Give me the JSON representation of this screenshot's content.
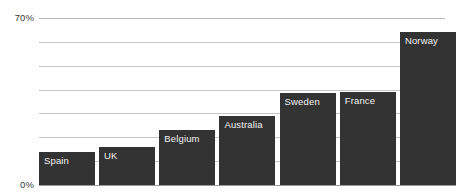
{
  "chart_data": {
    "type": "bar",
    "title": "",
    "subtitle": "",
    "xlabel": "",
    "ylabel": "",
    "categories": [
      "Spain",
      "UK",
      "Belgium",
      "Australia",
      "Sweden",
      "France",
      "Norway"
    ],
    "values": [
      14,
      16,
      23,
      29,
      38.5,
      39,
      64
    ],
    "value_suffix": "%",
    "ylim": [
      0,
      70
    ],
    "y_tick_labels": [
      "0%",
      "70%"
    ],
    "y_ticks_visible": [
      0,
      70
    ],
    "gridlines": [
      70,
      60,
      50,
      40,
      30,
      20,
      10
    ],
    "grid": true,
    "legend": "none",
    "bar_color": "#333333",
    "bar_label_color": "#f2f2f2",
    "gridline_color": "#b9b9b9",
    "axis_text_color": "#3c3c3c",
    "background_color": "#ffffff"
  },
  "axis": {
    "top_label": "70%",
    "bottom_label": "0%"
  },
  "bars": [
    {
      "label": "Spain",
      "value": 14
    },
    {
      "label": "UK",
      "value": 16
    },
    {
      "label": "Belgium",
      "value": 23
    },
    {
      "label": "Australia",
      "value": 29
    },
    {
      "label": "Sweden",
      "value": 38.5
    },
    {
      "label": "France",
      "value": 39
    },
    {
      "label": "Norway",
      "value": 64
    }
  ]
}
